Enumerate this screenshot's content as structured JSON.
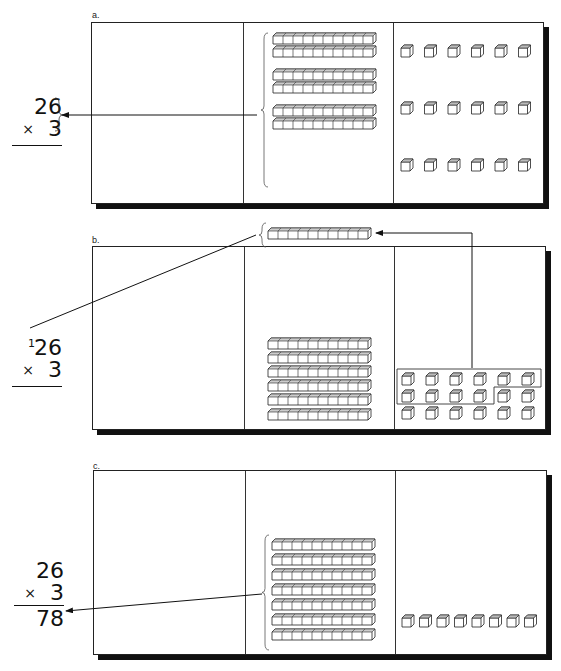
{
  "panels": [
    {
      "label": "a.",
      "problem": {
        "top": "26",
        "multiplier": "3",
        "operator": "×",
        "carry": "",
        "result": ""
      },
      "tens_rods": 6,
      "tens_rod_groups": [
        2,
        2,
        2
      ],
      "ones_cubes": 18,
      "ones_layout": "3 rows × 6"
    },
    {
      "label": "b.",
      "problem": {
        "top": "26",
        "multiplier": "3",
        "operator": "×",
        "carry": "1",
        "result": ""
      },
      "tens_rods": 6,
      "regrouped_rod": 1,
      "ones_cubes": 18,
      "ones_grouped_for_exchange": 10,
      "ones_remaining": 8
    },
    {
      "label": "c.",
      "problem": {
        "top": "26",
        "multiplier": "3",
        "operator": "×",
        "carry": "",
        "result": "78"
      },
      "tens_rods": 7,
      "ones_cubes": 8
    }
  ],
  "colors": {
    "ink": "#111111",
    "paper": "#ffffff",
    "shadow": "#111111"
  }
}
